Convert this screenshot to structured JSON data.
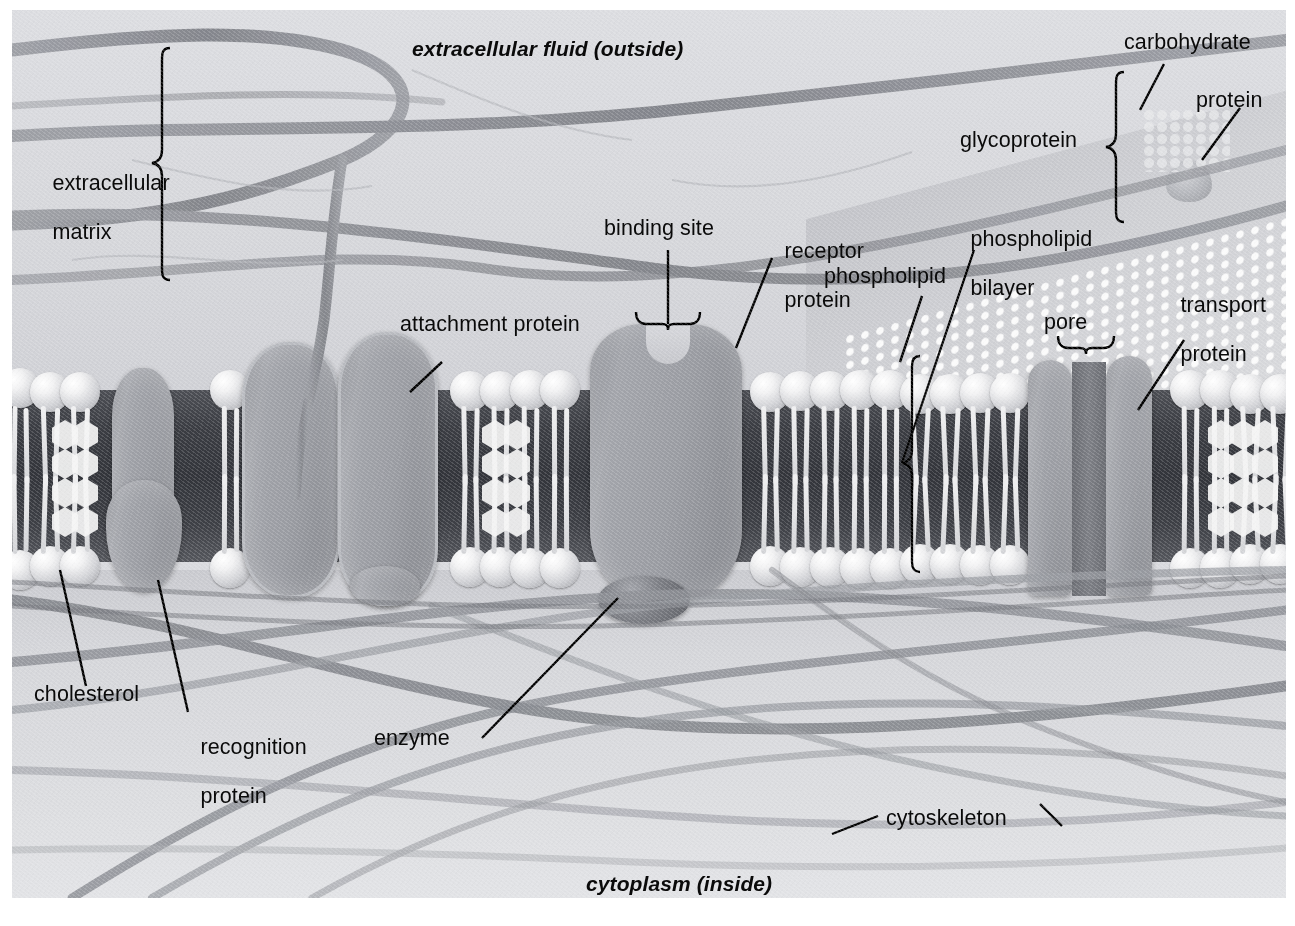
{
  "figure": {
    "region_labels": {
      "outside": "extracellular fluid (outside)",
      "inside": "cytoplasm (inside)"
    },
    "labels": [
      {
        "id": "extracellular-matrix",
        "text": "extracellular\nmatrix",
        "marker": "brace-right"
      },
      {
        "id": "extracellular-fluid",
        "text": "extracellular fluid (outside)",
        "marker": "none"
      },
      {
        "id": "carbohydrate",
        "text": "carbohydrate",
        "marker": "leader"
      },
      {
        "id": "protein",
        "text": "protein",
        "marker": "leader"
      },
      {
        "id": "glycoprotein",
        "text": "glycoprotein",
        "marker": "brace-right"
      },
      {
        "id": "binding-site",
        "text": "binding site",
        "marker": "brace-down"
      },
      {
        "id": "receptor-protein",
        "text": "receptor\nprotein",
        "marker": "leader"
      },
      {
        "id": "phospholipid",
        "text": "phospholipid",
        "marker": "leader"
      },
      {
        "id": "phospholipid-bilayer",
        "text": "phospholipid\nbilayer",
        "marker": "brace-vertical"
      },
      {
        "id": "attachment-protein",
        "text": "attachment protein",
        "marker": "leader"
      },
      {
        "id": "pore",
        "text": "pore",
        "marker": "brace-down"
      },
      {
        "id": "transport-protein",
        "text": "transport\nprotein",
        "marker": "leader"
      },
      {
        "id": "cholesterol",
        "text": "cholesterol",
        "marker": "leader"
      },
      {
        "id": "recognition-protein",
        "text": "recognition\nprotein",
        "marker": "leader"
      },
      {
        "id": "enzyme",
        "text": "enzyme",
        "marker": "leader"
      },
      {
        "id": "cytoskeleton",
        "text": "cytoskeleton",
        "marker": "leader-both"
      },
      {
        "id": "cytoplasm",
        "text": "cytoplasm (inside)",
        "marker": "none"
      }
    ],
    "label_text": {
      "extracellular_matrix_l1": "extracellular",
      "extracellular_matrix_l2": "matrix",
      "extracellular_fluid": "extracellular fluid (outside)",
      "carbohydrate": "carbohydrate",
      "protein": "protein",
      "glycoprotein": "glycoprotein",
      "binding_site": "binding site",
      "receptor_protein_l1": "receptor",
      "receptor_protein_l2": "protein",
      "phospholipid": "phospholipid",
      "phospholipid_bilayer_l1": "phospholipid",
      "phospholipid_bilayer_l2": "bilayer",
      "attachment_protein": "attachment protein",
      "pore": "pore",
      "transport_protein_l1": "transport",
      "transport_protein_l2": "protein",
      "cholesterol": "cholesterol",
      "recognition_protein_l1": "recognition",
      "recognition_protein_l2": "protein",
      "enzyme": "enzyme",
      "cytoskeleton": "cytoskeleton",
      "cytoplasm": "cytoplasm (inside)"
    },
    "colors": {
      "background": "#ffffff",
      "extracellular_fluid": "#dcdde1",
      "cytoplasm": "#d5d6da",
      "membrane_interior": "#33353b",
      "lipid_head": "#f2f2f3",
      "lipid_tail": "#e6e7e9",
      "protein_body": "#9a9ca2",
      "protein_rim": "#b9bbc0",
      "cholesterol": "#f4f4f4",
      "fiber": "#8a8c92",
      "label_text": "#0a0a0a",
      "leader_line": "#000000"
    },
    "structures": [
      "extracellular matrix fibers",
      "glycoprotein with carbohydrate chain",
      "phospholipid bilayer",
      "cholesterol molecules",
      "recognition protein",
      "attachment proteins",
      "receptor protein with binding site",
      "enzyme",
      "transport protein forming a pore",
      "cytoskeleton filaments"
    ]
  }
}
